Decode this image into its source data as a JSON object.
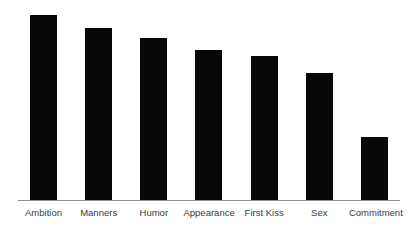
{
  "chart_data": {
    "type": "bar",
    "title": "",
    "subtitle": "",
    "xlabel": "",
    "ylabel": "",
    "categories": [
      "Ambition",
      "Manners",
      "Humor",
      "Appearance",
      "First Kiss",
      "Sex",
      "Commitment"
    ],
    "values": [
      100,
      93,
      88,
      81,
      78,
      69,
      34
    ],
    "ylim": [
      0,
      104
    ],
    "grid": false,
    "legend": null,
    "legend_position": "none",
    "axis_tick_labels": [],
    "annotations": [],
    "bar_color": "#070707",
    "axis_color": "#8f8f8f",
    "label_color": "#3a3a3a",
    "background_color": "#ffffff"
  }
}
